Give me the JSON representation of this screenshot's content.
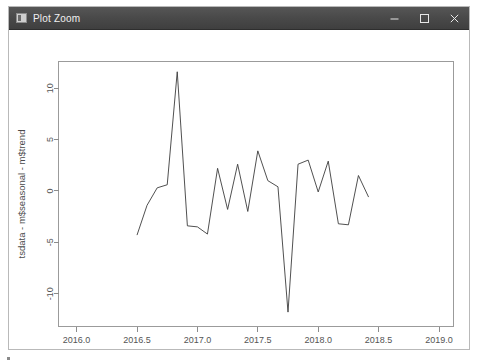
{
  "window": {
    "title": "Plot Zoom",
    "icon": "plot-window-icon",
    "controls": {
      "minimize_label": "–",
      "maximize_label": "□",
      "close_label": "✕"
    }
  },
  "chart_data": {
    "type": "line",
    "title": "",
    "xlabel": "Time",
    "ylabel": "tsdata - m$seasonal - m$trend",
    "xlim": [
      2015.85,
      2019.12
    ],
    "ylim": [
      -13.2,
      12.6
    ],
    "xticks": [
      2016.0,
      2016.5,
      2017.0,
      2017.5,
      2018.0,
      2018.5,
      2019.0
    ],
    "xticklabels": [
      "2016.0",
      "2016.5",
      "2017.0",
      "2017.5",
      "2018.0",
      "2018.5",
      "2019.0"
    ],
    "yticks": [
      -10,
      -5,
      0,
      5,
      10
    ],
    "yticklabels": [
      "-10",
      "-5",
      "0",
      "5",
      "10"
    ],
    "grid": false,
    "legend": false,
    "series": [
      {
        "name": "tsdata - m$seasonal - m$trend",
        "color": "#3c3c3c",
        "x": [
          2016.5,
          2016.583,
          2016.667,
          2016.75,
          2016.833,
          2016.917,
          2017.0,
          2017.083,
          2017.167,
          2017.25,
          2017.333,
          2017.417,
          2017.5,
          2017.583,
          2017.667,
          2017.75,
          2017.833,
          2017.917,
          2018.0,
          2018.083,
          2018.167,
          2018.25,
          2018.333,
          2018.417
        ],
        "y": [
          -4.3,
          -1.4,
          0.3,
          0.6,
          11.6,
          -3.4,
          -3.5,
          -4.2,
          2.2,
          -1.8,
          2.6,
          -2.0,
          3.9,
          1.0,
          0.4,
          -11.8,
          2.6,
          3.0,
          -0.1,
          2.9,
          -3.2,
          -3.3,
          1.5,
          -0.6
        ]
      }
    ]
  }
}
